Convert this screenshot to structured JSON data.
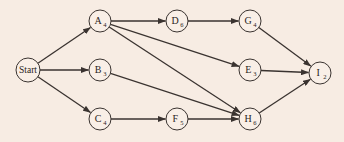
{
  "diagram": {
    "type": "activity-network",
    "colors": {
      "background": "#f7ece3",
      "node_fill": "#f9efe7",
      "stroke": "#3a3330"
    },
    "nodes": [
      {
        "id": "Start",
        "letter": "Start",
        "sub": "",
        "x": 28,
        "y": 70,
        "r": 12
      },
      {
        "id": "A",
        "letter": "A",
        "sub": "4",
        "x": 100,
        "y": 21,
        "r": 11
      },
      {
        "id": "B",
        "letter": "B",
        "sub": "3",
        "x": 100,
        "y": 70,
        "r": 11
      },
      {
        "id": "C",
        "letter": "C",
        "sub": "4",
        "x": 100,
        "y": 119,
        "r": 11
      },
      {
        "id": "D",
        "letter": "D",
        "sub": "6",
        "x": 177,
        "y": 21,
        "r": 11
      },
      {
        "id": "G",
        "letter": "G",
        "sub": "4",
        "x": 250,
        "y": 21,
        "r": 11
      },
      {
        "id": "E",
        "letter": "E",
        "sub": "3",
        "x": 250,
        "y": 70,
        "r": 11
      },
      {
        "id": "F",
        "letter": "F",
        "sub": "5",
        "x": 177,
        "y": 119,
        "r": 11
      },
      {
        "id": "H",
        "letter": "H",
        "sub": "6",
        "x": 250,
        "y": 119,
        "r": 11
      },
      {
        "id": "I",
        "letter": "I",
        "sub": "2",
        "x": 320,
        "y": 73,
        "r": 11
      }
    ],
    "edges": [
      [
        "Start",
        "A"
      ],
      [
        "Start",
        "B"
      ],
      [
        "Start",
        "C"
      ],
      [
        "A",
        "D"
      ],
      [
        "D",
        "G"
      ],
      [
        "A",
        "E"
      ],
      [
        "A",
        "H"
      ],
      [
        "B",
        "H"
      ],
      [
        "C",
        "F"
      ],
      [
        "F",
        "H"
      ],
      [
        "G",
        "I"
      ],
      [
        "E",
        "I"
      ],
      [
        "H",
        "I"
      ]
    ]
  }
}
